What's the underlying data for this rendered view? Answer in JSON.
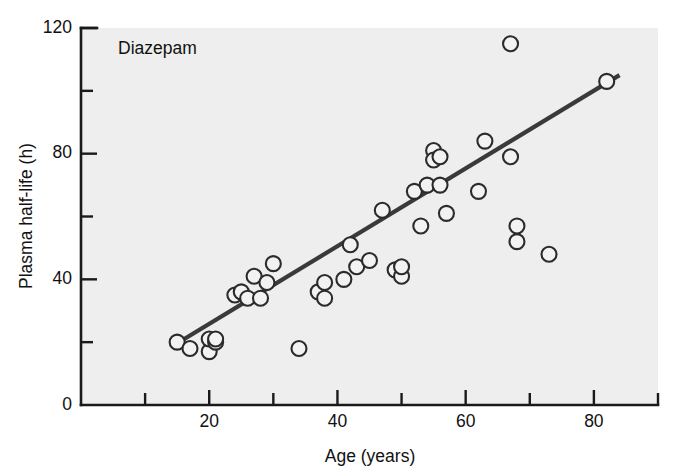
{
  "chart_data": {
    "type": "scatter",
    "title": "",
    "annotation": "Diazepam",
    "xlabel": "Age (years)",
    "ylabel": "Plasma half-life (h)",
    "xlim": [
      0,
      90
    ],
    "ylim": [
      0,
      120
    ],
    "grid": false,
    "legend": null,
    "x_ticks_major": [
      20,
      40,
      60,
      80
    ],
    "x_ticks_minor": [
      10,
      30,
      50,
      70,
      90
    ],
    "x_tick_labels": [
      "20",
      "40",
      "60",
      "80"
    ],
    "y_ticks_major": [
      0,
      40,
      80,
      120
    ],
    "y_ticks_minor": [
      20,
      60,
      100
    ],
    "y_tick_labels": [
      "0",
      "40",
      "80",
      "120"
    ],
    "x": [
      15,
      17,
      20,
      20,
      21,
      21,
      24,
      25,
      26,
      27,
      28,
      29,
      30,
      34,
      37,
      38,
      38,
      41,
      42,
      43,
      45,
      47,
      49,
      50,
      50,
      52,
      53,
      54,
      55,
      55,
      56,
      56,
      57,
      62,
      63,
      67,
      67,
      68,
      68,
      73,
      82
    ],
    "y": [
      20,
      18,
      17,
      21,
      20,
      21,
      35,
      36,
      34,
      41,
      34,
      39,
      45,
      18,
      36,
      34,
      39,
      40,
      51,
      44,
      46,
      62,
      43,
      41,
      44,
      68,
      57,
      70,
      81,
      78,
      79,
      70,
      61,
      68,
      84,
      115,
      79,
      52,
      57,
      48,
      103
    ],
    "points": [
      {
        "x": 15,
        "y": 20
      },
      {
        "x": 17,
        "y": 18
      },
      {
        "x": 20,
        "y": 17
      },
      {
        "x": 20,
        "y": 21
      },
      {
        "x": 21,
        "y": 20
      },
      {
        "x": 21,
        "y": 21
      },
      {
        "x": 24,
        "y": 35
      },
      {
        "x": 25,
        "y": 36
      },
      {
        "x": 26,
        "y": 34
      },
      {
        "x": 27,
        "y": 41
      },
      {
        "x": 28,
        "y": 34
      },
      {
        "x": 29,
        "y": 39
      },
      {
        "x": 30,
        "y": 45
      },
      {
        "x": 34,
        "y": 18
      },
      {
        "x": 37,
        "y": 36
      },
      {
        "x": 38,
        "y": 34
      },
      {
        "x": 38,
        "y": 39
      },
      {
        "x": 41,
        "y": 40
      },
      {
        "x": 42,
        "y": 51
      },
      {
        "x": 43,
        "y": 44
      },
      {
        "x": 45,
        "y": 46
      },
      {
        "x": 47,
        "y": 62
      },
      {
        "x": 49,
        "y": 43
      },
      {
        "x": 50,
        "y": 41
      },
      {
        "x": 50,
        "y": 44
      },
      {
        "x": 52,
        "y": 68
      },
      {
        "x": 53,
        "y": 57
      },
      {
        "x": 54,
        "y": 70
      },
      {
        "x": 55,
        "y": 81
      },
      {
        "x": 55,
        "y": 78
      },
      {
        "x": 56,
        "y": 79
      },
      {
        "x": 56,
        "y": 70
      },
      {
        "x": 57,
        "y": 61
      },
      {
        "x": 62,
        "y": 68
      },
      {
        "x": 63,
        "y": 84
      },
      {
        "x": 67,
        "y": 115
      },
      {
        "x": 67,
        "y": 79
      },
      {
        "x": 68,
        "y": 52
      },
      {
        "x": 68,
        "y": 57
      },
      {
        "x": 73,
        "y": 48
      },
      {
        "x": 82,
        "y": 103
      }
    ],
    "marker": {
      "shape": "open-circle",
      "radius_px": 7.5,
      "fill": "#f2f2f2",
      "edge": "#2b2b2b"
    },
    "trendline": {
      "type": "linear-fit",
      "x_start": 14.5,
      "y_start": 19,
      "x_end": 84,
      "y_end": 105,
      "color": "#3a3a3a"
    },
    "colors": {
      "panel_background": "#eeeeee",
      "page_background": "#ffffff",
      "axis": "#1a1a1a",
      "text": "#111111",
      "marker_edge": "#2b2b2b",
      "trendline": "#3a3a3a"
    }
  }
}
